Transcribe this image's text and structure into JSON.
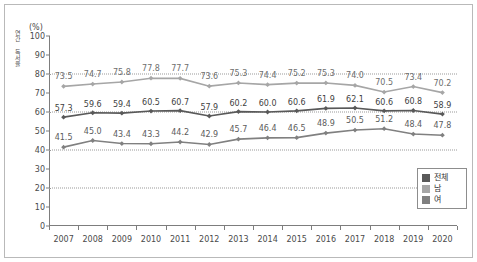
{
  "chart_data": {
    "type": "line",
    "title": "",
    "subtitle": "",
    "unit_label": "(%)",
    "ylabel": "연간 독서율",
    "xlabel": "",
    "ylim": [
      0,
      100
    ],
    "yticks": [
      0,
      10,
      20,
      30,
      40,
      50,
      60,
      70,
      80,
      90,
      100
    ],
    "gridlines": [
      20,
      40,
      60,
      80
    ],
    "grid": true,
    "legend_position": "bottom-right",
    "categories": [
      "2007",
      "2008",
      "2009",
      "2010",
      "2011",
      "2012",
      "2013",
      "2014",
      "2015",
      "2016",
      "2017",
      "2018",
      "2019",
      "2020"
    ],
    "series": [
      {
        "name": "전체",
        "color": "#595959",
        "values": [
          57.3,
          59.6,
          59.4,
          60.5,
          60.7,
          57.9,
          60.2,
          60.0,
          60.6,
          61.9,
          62.1,
          60.6,
          60.8,
          58.9
        ],
        "labels": [
          "57.3",
          "59.6",
          "59.4",
          "60.5",
          "60.7",
          "57.9",
          "60.2",
          "60.0",
          "60.6",
          "61.9",
          "62.1",
          "60.6",
          "60.8",
          "58.9"
        ]
      },
      {
        "name": "남",
        "color": "#a6a6a6",
        "values": [
          73.5,
          74.7,
          75.8,
          77.8,
          77.7,
          73.6,
          75.3,
          74.4,
          75.2,
          75.3,
          74.0,
          70.5,
          73.4,
          70.2
        ],
        "labels": [
          "73.5",
          "74.7",
          "75.8",
          "77.8",
          "77.7",
          "73.6",
          "75.3",
          "74.4",
          "75.2",
          "75.3",
          "74.0",
          "70.5",
          "73.4",
          "70.2"
        ]
      },
      {
        "name": "여",
        "color": "#808080",
        "values": [
          41.5,
          45.0,
          43.4,
          43.3,
          44.2,
          42.9,
          45.7,
          46.4,
          46.5,
          48.9,
          50.5,
          51.2,
          48.4,
          47.8
        ],
        "labels": [
          "41.5",
          "45.0",
          "43.4",
          "43.3",
          "44.2",
          "42.9",
          "45.7",
          "46.4",
          "46.5",
          "48.9",
          "50.5",
          "51.2",
          "48.4",
          "47.8"
        ]
      }
    ]
  },
  "legend": {
    "items": [
      {
        "label": "전체",
        "color": "#595959"
      },
      {
        "label": "남",
        "color": "#a6a6a6"
      },
      {
        "label": "여",
        "color": "#808080"
      }
    ]
  }
}
